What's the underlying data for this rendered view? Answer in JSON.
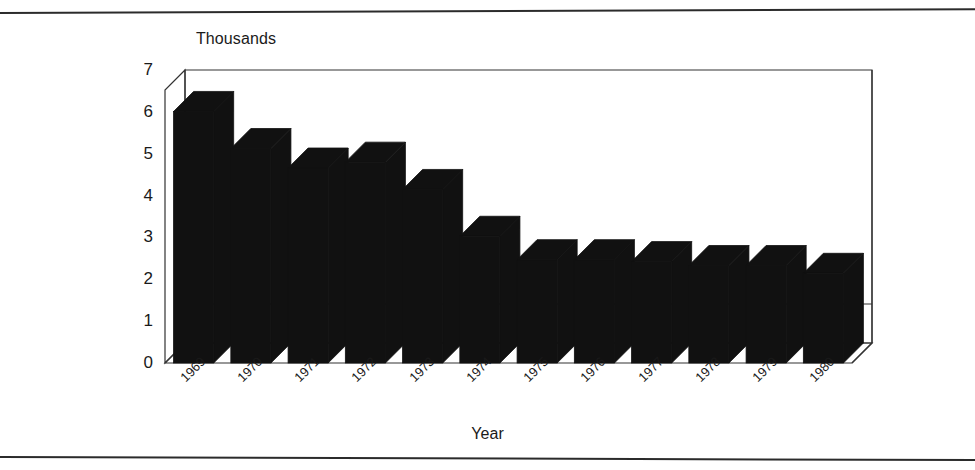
{
  "figure": {
    "y_axis_title": "Thousands",
    "x_axis_title": "Year",
    "bar_color": "#111111",
    "axis_color": "#333333",
    "background": "#ffffff"
  },
  "chart_data": {
    "type": "bar",
    "title": "",
    "subtitle": "",
    "xlabel": "Year",
    "ylabel": "Thousands",
    "categories": [
      "1969",
      "1970",
      "1971",
      "1972",
      "1973",
      "1974",
      "1975",
      "1976",
      "1977",
      "1978",
      "1979",
      "1980"
    ],
    "values": [
      6.45,
      5.5,
      5.0,
      5.15,
      4.45,
      3.25,
      2.65,
      2.65,
      2.6,
      2.5,
      2.5,
      2.3
    ],
    "ylim": [
      0,
      7
    ],
    "yticks": [
      "0",
      "1",
      "2",
      "3",
      "4",
      "5",
      "6",
      "7"
    ],
    "ytick_values": [
      0,
      1,
      2,
      3,
      4,
      5,
      6,
      7
    ],
    "grid": "horizontal-gridline-at-1-only",
    "legend": "none",
    "legend_position": "none",
    "style": "3d-column",
    "annotations": []
  }
}
